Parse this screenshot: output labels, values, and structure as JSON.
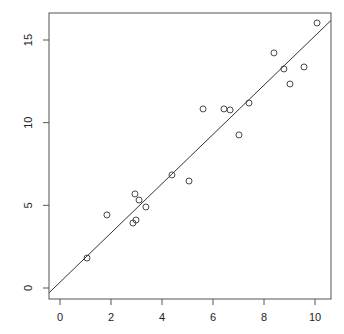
{
  "chart_data": {
    "type": "scatter",
    "title": "",
    "xlabel": "",
    "ylabel": "",
    "xlim": [
      -0.43,
      10.63
    ],
    "ylim": [
      -0.7,
      16.5
    ],
    "grid": false,
    "legend": null,
    "x_ticks": [
      0,
      2,
      4,
      6,
      8,
      10
    ],
    "y_ticks": [
      0,
      5,
      10,
      15
    ],
    "x_tick_labels": [
      "0",
      "2",
      "4",
      "6",
      "8",
      "10"
    ],
    "y_tick_labels": [
      "0",
      "5",
      "10",
      "15"
    ],
    "series": [
      {
        "name": "points",
        "marker": "open-circle",
        "x": [
          1.06,
          1.84,
          2.94,
          3.1,
          3.37,
          2.86,
          2.98,
          4.39,
          5.06,
          5.61,
          6.43,
          6.67,
          7.41,
          7.02,
          8.39,
          8.78,
          9.57,
          9.02,
          10.08
        ],
        "y": [
          1.81,
          4.42,
          5.69,
          5.32,
          4.9,
          3.93,
          4.11,
          6.84,
          6.47,
          10.83,
          10.83,
          10.77,
          11.19,
          9.26,
          14.22,
          13.25,
          13.37,
          12.34,
          16.03
        ]
      }
    ],
    "annotations": [
      {
        "type": "abline",
        "name": "fitted line",
        "intercept": 0.35,
        "slope": 1.49
      }
    ],
    "colors": {
      "points": "#333333",
      "line": "#333333",
      "axes": "#555555"
    }
  }
}
